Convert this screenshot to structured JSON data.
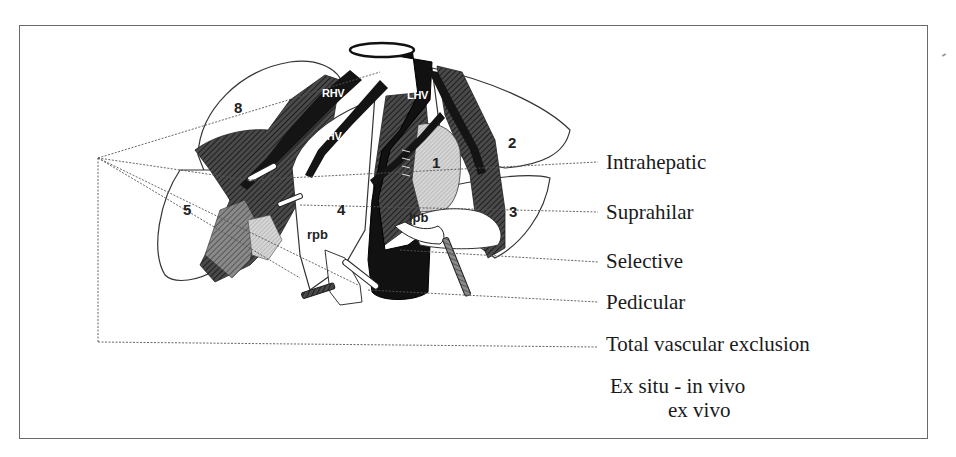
{
  "figure": {
    "type": "anatomical-diagram"
  },
  "anatomy": {
    "veins": [
      {
        "id": "rhv",
        "label": "RHV"
      },
      {
        "id": "mhv",
        "label": "MHV"
      },
      {
        "id": "lhv",
        "label": "LHV"
      }
    ],
    "segments": [
      {
        "id": "seg1",
        "label": "1"
      },
      {
        "id": "seg2",
        "label": "2"
      },
      {
        "id": "seg3",
        "label": "3"
      },
      {
        "id": "seg4",
        "label": "4"
      },
      {
        "id": "seg5",
        "label": "5"
      },
      {
        "id": "seg8",
        "label": "8"
      }
    ],
    "branches": [
      {
        "id": "rpb",
        "label": "rpb"
      },
      {
        "id": "lpb",
        "label": "lpb"
      }
    ]
  },
  "legend": {
    "items": [
      {
        "id": "intrahepatic",
        "label": "Intrahepatic"
      },
      {
        "id": "suprahilar",
        "label": "Suprahilar"
      },
      {
        "id": "selective",
        "label": "Selective"
      },
      {
        "id": "pedicular",
        "label": "Pedicular"
      },
      {
        "id": "total-vascular-exclusion",
        "label": "Total vascular exclusion"
      },
      {
        "id": "ex-situ",
        "label": "Ex situ - in vivo"
      },
      {
        "id": "ex-vivo",
        "label": "ex vivo"
      }
    ]
  },
  "colors": {
    "frame": "#6a6a6a",
    "ivc": "#111111",
    "dark_hatch": "#3a3a3a",
    "mid_hatch": "#6e6e6e",
    "light_hatch": "#c8c8c8",
    "line": "#555555",
    "background": "#ffffff"
  }
}
